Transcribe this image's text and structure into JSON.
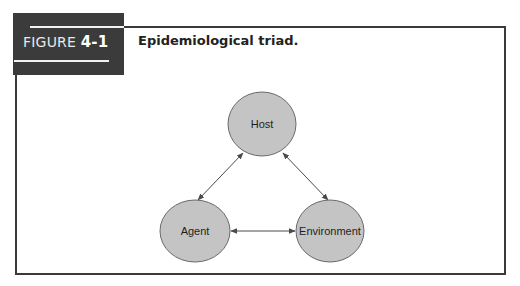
{
  "figure": {
    "label_prefix": "FIGURE",
    "label_number": "4-1",
    "title": "Epidemiological triad."
  },
  "diagram": {
    "colors": {
      "node_fill": "#c4c4c4",
      "node_stroke": "#6a6a6a",
      "arrow": "#4a4a4a",
      "frame": "#3a3a3a",
      "label_block": "#3b3b3b"
    },
    "nodes": [
      {
        "id": "host",
        "label": "Host"
      },
      {
        "id": "agent",
        "label": "Agent"
      },
      {
        "id": "environment",
        "label": "Environment"
      }
    ],
    "edges": [
      {
        "from": "host",
        "to": "agent",
        "bidirectional": true
      },
      {
        "from": "host",
        "to": "environment",
        "bidirectional": true
      },
      {
        "from": "agent",
        "to": "environment",
        "bidirectional": true
      }
    ]
  }
}
